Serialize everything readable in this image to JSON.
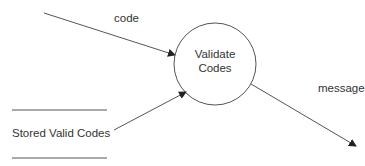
{
  "diagram": {
    "type": "data-flow-diagram",
    "process": {
      "line1": "Validate",
      "line2": "Codes"
    },
    "data_store": {
      "label": "Stored Valid Codes"
    },
    "flows": [
      {
        "label": "code",
        "from": "external",
        "to": "Validate Codes"
      },
      {
        "label": "",
        "from": "Stored Valid Codes",
        "to": "Validate Codes"
      },
      {
        "label": "message",
        "from": "Validate Codes",
        "to": "external"
      }
    ],
    "colors": {
      "stroke": "#555555",
      "text": "#333333",
      "background": "#ffffff"
    }
  }
}
